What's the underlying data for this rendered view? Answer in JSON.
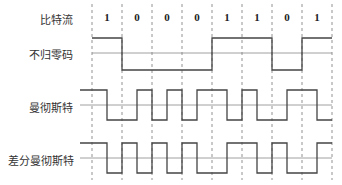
{
  "labels": {
    "bitstream": "比特流",
    "nrz": "不归零码",
    "manchester": "曼彻斯特",
    "diff_manchester": "差分曼彻斯特"
  },
  "bits": [
    "1",
    "0",
    "0",
    "0",
    "1",
    "1",
    "0",
    "1"
  ],
  "colors": {
    "signal": "#444444",
    "baseline": "#888888",
    "dashed": "#777777",
    "text": "#333333"
  }
}
